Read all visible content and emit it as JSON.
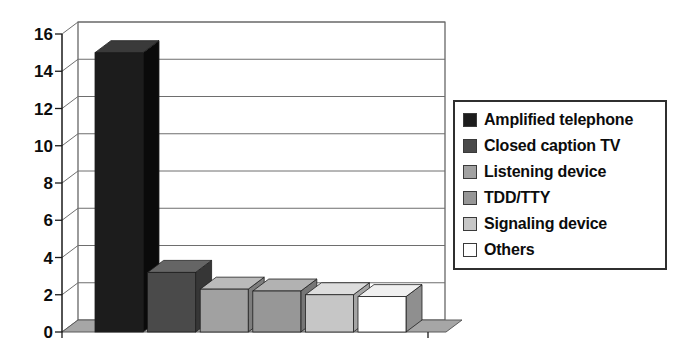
{
  "chart_data": {
    "type": "bar",
    "projection": "3d",
    "title": "",
    "xlabel": "",
    "ylabel": "",
    "categories": [
      "Amplified telephone",
      "Closed caption TV",
      "Listening device",
      "TDD/TTY",
      "Signaling device",
      "Others"
    ],
    "values": [
      15,
      3.2,
      2.3,
      2.2,
      2.0,
      1.9
    ],
    "ylim": [
      0,
      16
    ],
    "yticks": [
      0,
      2,
      4,
      6,
      8,
      10,
      12,
      14,
      16
    ],
    "grid": true,
    "legend_position": "right",
    "bar_colors": [
      "#1c1c1c",
      "#4a4a4a",
      "#a1a1a1",
      "#979797",
      "#c6c6c6",
      "#ffffff"
    ],
    "bar_top_colors": [
      "#3a3a3a",
      "#656565",
      "#bababa",
      "#b2b2b2",
      "#dddddd",
      "#f0f0f0"
    ],
    "bar_side_colors": [
      "#0a0a0a",
      "#363636",
      "#7d7d7d",
      "#767676",
      "#a4a4a4",
      "#8f8f8f"
    ]
  },
  "colors": {
    "background": "#ffffff",
    "floor": "#a6a6a6",
    "gridline": "#6e6e6e",
    "wall_border": "#5a5a5a",
    "axis": "#1a1a1a",
    "tick_label": "#0c0c0c",
    "legend_border": "#2f2f2f",
    "bar_outline": "#1f1f1f"
  }
}
